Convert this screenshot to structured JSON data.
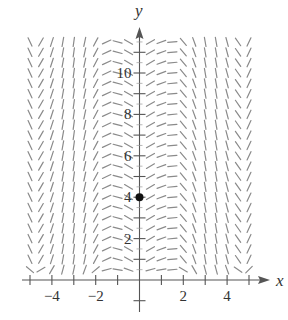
{
  "figure": {
    "type": "slope-field",
    "x_axis_label": "x",
    "y_axis_label": "y",
    "x_tick_labels": [
      {
        "value": -4,
        "text": "−4"
      },
      {
        "value": -2,
        "text": "−2"
      },
      {
        "value": 2,
        "text": "2"
      },
      {
        "value": 4,
        "text": "4"
      }
    ],
    "y_tick_labels": [
      {
        "value": 2,
        "text": "2"
      },
      {
        "value": 4,
        "text": "4"
      },
      {
        "value": 6,
        "text": "6"
      },
      {
        "value": 8,
        "text": "8"
      },
      {
        "value": 10,
        "text": "10"
      }
    ],
    "x_ticks": [
      -5,
      -4,
      -3,
      -2,
      -1,
      1,
      2,
      3,
      4,
      5
    ],
    "y_ticks": [
      -1,
      1,
      2,
      3,
      4,
      5,
      6,
      7,
      8,
      9,
      10,
      11
    ],
    "x_range": [
      -5.2,
      5.8
    ],
    "y_range": [
      -1.3,
      12.3
    ],
    "initial_point": {
      "x": 0,
      "y": 4
    },
    "field": {
      "x_values": [
        -5,
        -4.5,
        -4,
        -3.5,
        -3,
        -2.5,
        -2,
        -1.5,
        -1,
        -0.5,
        0.5,
        1,
        1.5,
        2,
        2.5,
        3,
        3.5,
        4,
        4.5,
        5
      ],
      "angles_deg": [
        -65,
        60,
        72,
        80,
        82,
        78,
        62,
        25,
        -15,
        -30,
        30,
        20,
        5,
        -50,
        -70,
        -80,
        -80,
        -75,
        -55,
        65
      ],
      "bottom_row_angles_deg": [
        -40,
        30,
        60,
        75,
        78,
        70,
        40,
        15,
        -10,
        -20,
        15,
        10,
        5,
        -30,
        -60,
        -75,
        -75,
        -70,
        -35,
        45
      ],
      "y_start": 0.5,
      "y_end": 11.5,
      "y_step": 0.5
    },
    "colors": {
      "segments": "#8a8a8a",
      "axes": "#555555",
      "point": "#111111"
    }
  }
}
